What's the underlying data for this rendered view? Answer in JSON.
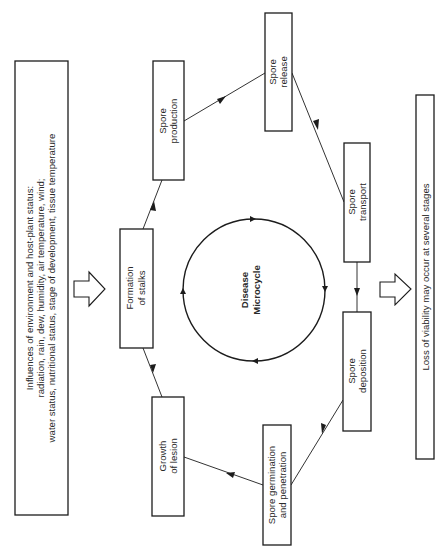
{
  "diagram": {
    "orientation": "rotated-90-ccw",
    "center": {
      "title_line1": "Disease",
      "title_line2": "Microcycle",
      "cycle_direction": "clockwise"
    },
    "influence_box": {
      "line1": "Influences of environment and host-plant status:",
      "line2": "radiation, rain, dew, humidity, air temperature, wind;",
      "line3": "water status, nutritional status, stage of development, tissue temperature"
    },
    "loss_box": {
      "text": "Loss of viability may occur at several stages"
    },
    "stages": [
      {
        "id": "spore-production",
        "line1": "Spore",
        "line2": "production"
      },
      {
        "id": "spore-release",
        "line1": "Spore",
        "line2": "release"
      },
      {
        "id": "spore-transport",
        "line1": "Spore",
        "line2": "transport"
      },
      {
        "id": "spore-deposition",
        "line1": "Spore",
        "line2": "deposition"
      },
      {
        "id": "spore-germination",
        "line1": "Spore germination",
        "line2": "and penetration"
      },
      {
        "id": "growth-of-lesion",
        "line1": "Growth",
        "line2": "of lesion"
      },
      {
        "id": "formation-of-stalks",
        "line1": "Formation",
        "line2": "of stalks"
      }
    ],
    "flow": [
      [
        "formation-of-stalks",
        "spore-production"
      ],
      [
        "spore-production",
        "spore-release"
      ],
      [
        "spore-release",
        "spore-transport"
      ],
      [
        "spore-transport",
        "spore-deposition"
      ],
      [
        "spore-deposition",
        "spore-germination"
      ],
      [
        "spore-germination",
        "growth-of-lesion"
      ],
      [
        "growth-of-lesion",
        "formation-of-stalks"
      ]
    ],
    "colors": {
      "line": "#1c1c1c",
      "text": "#2a2a2a",
      "background": "#ffffff"
    }
  }
}
